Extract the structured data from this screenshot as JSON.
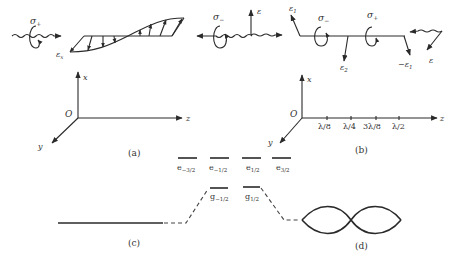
{
  "colors": {
    "ink": "#2a2a2a",
    "label": "#333333",
    "background": "#ffffff"
  },
  "panel_a": {
    "label": "(a)",
    "sigma_plus": "σ",
    "sigma_plus_sub": "+",
    "sigma_minus": "σ",
    "sigma_minus_sub": "−",
    "field_label": "ε",
    "field_sub": "x",
    "axes": {
      "x": "x",
      "z": "z",
      "y": "y",
      "origin": "O"
    }
  },
  "panel_b": {
    "label": "(b)",
    "field_left": "ε",
    "e1": "ε",
    "e1_sub": "1",
    "sigma_minus": "σ",
    "sigma_minus_sub": "−",
    "e2": "ε",
    "e2_sub": "2",
    "sigma_plus": "σ",
    "sigma_plus_sub": "+",
    "minus_e1": "−ε",
    "minus_e1_sub": "1",
    "field_right": "ε",
    "axes": {
      "x": "x",
      "z": "z",
      "y": "y",
      "origin": "O"
    },
    "ticks": [
      "λ/8",
      "λ/4",
      "3λ/8",
      "λ/2"
    ]
  },
  "panel_c": {
    "label": "(c)",
    "excited_levels": [
      {
        "name": "e",
        "sub": "−3/2"
      },
      {
        "name": "e",
        "sub": "−1/2"
      },
      {
        "name": "e",
        "sub": "1/2"
      },
      {
        "name": "e",
        "sub": "3/2"
      }
    ],
    "ground_levels": [
      {
        "name": "g",
        "sub": "−1/2"
      },
      {
        "name": "g",
        "sub": "1/2"
      }
    ]
  },
  "panel_d": {
    "label": "(d)"
  }
}
